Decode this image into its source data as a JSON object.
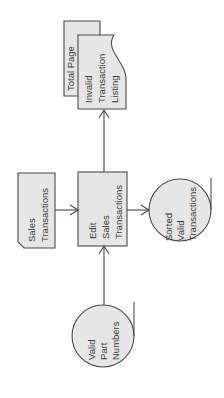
{
  "diagram": {
    "type": "system flowchart (rotated 90°)",
    "colors": {
      "fill": "#e6e6e6",
      "stroke": "#4a4a4a",
      "text": "#3a3a3a",
      "background": "#ffffff"
    },
    "nodes": {
      "total_page": {
        "shape": "document",
        "label": [
          "Total Page"
        ]
      },
      "invalid_listing": {
        "shape": "document",
        "label": [
          "Invalid",
          "Transaction",
          "Listing"
        ]
      },
      "sales_transactions": {
        "shape": "punched-card",
        "label": [
          "Sales",
          "Transactions"
        ]
      },
      "edit_process": {
        "shape": "process",
        "label": [
          "Edit",
          "Sales",
          "Transactions"
        ]
      },
      "sorted_valid": {
        "shape": "magnetic-tape",
        "label": [
          "Sorted",
          "Valid",
          "Transactions"
        ]
      },
      "valid_parts": {
        "shape": "magnetic-tape",
        "label": [
          "Valid",
          "Part",
          "Numbers"
        ]
      }
    },
    "edges": [
      {
        "from": "Sales Transactions",
        "to": "Edit Sales Transactions"
      },
      {
        "from": "Edit Sales Transactions",
        "to": "Sorted Valid Transactions"
      },
      {
        "from": "Edit Sales Transactions",
        "to": "Invalid Transaction Listing"
      },
      {
        "from": "Valid Part Numbers",
        "to": "Edit Sales Transactions"
      }
    ]
  }
}
